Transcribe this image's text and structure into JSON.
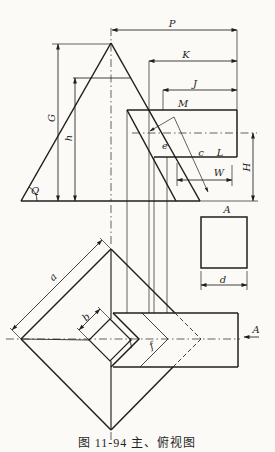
{
  "colors": {
    "ink": "#1f1f1f",
    "paper": "#fbfaf7"
  },
  "caption": "图 11-94  主、俯视图",
  "labels": {
    "P": "P",
    "K": "K",
    "J": "J",
    "M": "M",
    "G": "G",
    "h": "h",
    "Q": "Q",
    "e": "e",
    "c": "c",
    "L": "L",
    "W": "W",
    "H": "H",
    "A_view": "A",
    "d": "d",
    "a": "a",
    "b": "b",
    "f1": "f",
    "f2": "f",
    "A_arrow": "A"
  }
}
